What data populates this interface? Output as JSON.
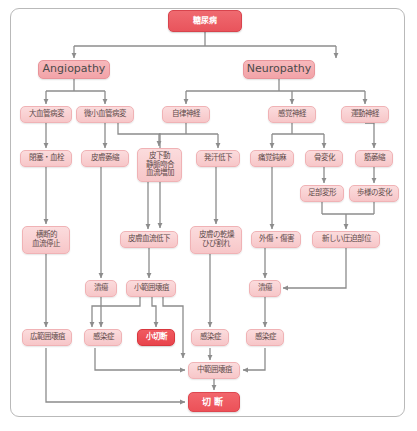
{
  "diagram": {
    "edge_color": "#8c8c8c",
    "accent_color": "#e8545c",
    "node_fill_light": "#fbdcdd",
    "node_fill_mid": "#f7b9bc",
    "frame_color": "#b9b9b9"
  },
  "nodes": [
    {
      "id": "root",
      "label": "糖尿病",
      "variant": "root",
      "x": 168,
      "y": 10,
      "w": 74,
      "h": 22
    },
    {
      "id": "angiopathy",
      "label": "Angiopathy",
      "variant": "en",
      "x": 38,
      "y": 60,
      "w": 72,
      "h": 19
    },
    {
      "id": "neuropathy",
      "label": "Neuropathy",
      "variant": "en",
      "x": 243,
      "y": 60,
      "w": 72,
      "h": 19
    },
    {
      "id": "macro",
      "label": "大血管病変",
      "variant": "jp",
      "x": 20,
      "y": 106,
      "w": 52,
      "h": 17
    },
    {
      "id": "micro",
      "label": "微小血管病変",
      "variant": "jp",
      "x": 76,
      "y": 106,
      "w": 58,
      "h": 17
    },
    {
      "id": "autonomic",
      "label": "自律神経",
      "variant": "jp",
      "x": 162,
      "y": 106,
      "w": 48,
      "h": 17
    },
    {
      "id": "sensory",
      "label": "感覚神経",
      "variant": "jp",
      "x": 268,
      "y": 106,
      "w": 48,
      "h": 17
    },
    {
      "id": "motor",
      "label": "運動神経",
      "variant": "jp",
      "x": 341,
      "y": 106,
      "w": 48,
      "h": 17
    },
    {
      "id": "occlusion",
      "label": "閉塞・血栓",
      "variant": "jp",
      "x": 20,
      "y": 150,
      "w": 52,
      "h": 17
    },
    {
      "id": "skinatrophy",
      "label": "皮膚萎縮",
      "variant": "jp",
      "x": 81,
      "y": 150,
      "w": 48,
      "h": 17
    },
    {
      "id": "avshunt",
      "label": "皮下動\n静脈吻合\n血流増加",
      "variant": "jp",
      "x": 137,
      "y": 148,
      "w": 45,
      "h": 34
    },
    {
      "id": "sweating",
      "label": "発汗低下",
      "variant": "jp",
      "x": 196,
      "y": 150,
      "w": 44,
      "h": 17
    },
    {
      "id": "painloss",
      "label": "痛覚鈍麻",
      "variant": "jp",
      "x": 250,
      "y": 150,
      "w": 44,
      "h": 17
    },
    {
      "id": "bonechange",
      "label": "骨変化",
      "variant": "jp",
      "x": 305,
      "y": 150,
      "w": 38,
      "h": 17
    },
    {
      "id": "muscleatr",
      "label": "筋萎縮",
      "variant": "jp",
      "x": 355,
      "y": 150,
      "w": 38,
      "h": 17
    },
    {
      "id": "footdeform",
      "label": "足部変形",
      "variant": "jp",
      "x": 300,
      "y": 185,
      "w": 44,
      "h": 17
    },
    {
      "id": "gaitchange",
      "label": "歩様の変化",
      "variant": "jp",
      "x": 349,
      "y": 185,
      "w": 50,
      "h": 17
    },
    {
      "id": "flowstop",
      "label": "横断的\n血流停止",
      "variant": "jp",
      "x": 22,
      "y": 226,
      "w": 48,
      "h": 28
    },
    {
      "id": "skinflow",
      "label": "皮膚血流低下",
      "variant": "jp",
      "x": 120,
      "y": 231,
      "w": 58,
      "h": 17
    },
    {
      "id": "drycrack",
      "label": "皮膚の乾燥\nひび割れ",
      "variant": "jp",
      "x": 190,
      "y": 226,
      "w": 52,
      "h": 28
    },
    {
      "id": "trauma",
      "label": "外傷・傷害",
      "variant": "jp",
      "x": 251,
      "y": 231,
      "w": 50,
      "h": 17
    },
    {
      "id": "newpress",
      "label": "新しい圧迫部位",
      "variant": "jp",
      "x": 312,
      "y": 231,
      "w": 68,
      "h": 17
    },
    {
      "id": "ulcer1",
      "label": "潰瘍",
      "variant": "jp",
      "x": 85,
      "y": 280,
      "w": 32,
      "h": 17
    },
    {
      "id": "smallgang",
      "label": "小範囲壊疽",
      "variant": "jp",
      "x": 126,
      "y": 280,
      "w": 50,
      "h": 17
    },
    {
      "id": "ulcer2",
      "label": "潰瘍",
      "variant": "jp",
      "x": 249,
      "y": 280,
      "w": 32,
      "h": 17
    },
    {
      "id": "widegang",
      "label": "広範囲壊疽",
      "variant": "jp",
      "x": 22,
      "y": 329,
      "w": 50,
      "h": 17
    },
    {
      "id": "infect1",
      "label": "感染症",
      "variant": "jp",
      "x": 84,
      "y": 329,
      "w": 38,
      "h": 17
    },
    {
      "id": "minoramp",
      "label": "小切断",
      "variant": "hl",
      "x": 137,
      "y": 329,
      "w": 38,
      "h": 17
    },
    {
      "id": "infect2",
      "label": "感染症",
      "variant": "jp",
      "x": 191,
      "y": 329,
      "w": 38,
      "h": 17
    },
    {
      "id": "infect3",
      "label": "感染症",
      "variant": "jp",
      "x": 246,
      "y": 329,
      "w": 38,
      "h": 17
    },
    {
      "id": "midgang",
      "label": "中範囲壊疽",
      "variant": "jp",
      "x": 188,
      "y": 362,
      "w": 52,
      "h": 17
    },
    {
      "id": "amputation",
      "label": "切断",
      "variant": "end",
      "x": 188,
      "y": 392,
      "w": 52,
      "h": 20
    }
  ],
  "edges": [
    {
      "from": "root",
      "to": "angiopathy",
      "kind": "tree-down"
    },
    {
      "from": "root",
      "to": "neuropathy",
      "kind": "tree-down"
    },
    {
      "from": "angiopathy",
      "to": "macro",
      "kind": "tree-down"
    },
    {
      "from": "angiopathy",
      "to": "micro",
      "kind": "tree-down"
    },
    {
      "from": "neuropathy",
      "to": "autonomic",
      "kind": "tree-down"
    },
    {
      "from": "neuropathy",
      "to": "sensory",
      "kind": "tree-down"
    },
    {
      "from": "neuropathy",
      "to": "motor",
      "kind": "tree-down"
    },
    {
      "from": "macro",
      "to": "occlusion",
      "kind": "straight"
    },
    {
      "from": "micro",
      "to": "skinatrophy",
      "kind": "tree-down"
    },
    {
      "from": "micro",
      "to": "skinflow",
      "kind": "elbow"
    },
    {
      "from": "autonomic",
      "to": "avshunt",
      "kind": "tree-down"
    },
    {
      "from": "autonomic",
      "to": "sweating",
      "kind": "tree-down"
    },
    {
      "from": "sensory",
      "to": "painloss",
      "kind": "tree-down"
    },
    {
      "from": "sensory",
      "to": "bonechange",
      "kind": "tree-down"
    },
    {
      "from": "motor",
      "to": "muscleatr",
      "kind": "straight"
    },
    {
      "from": "bonechange",
      "to": "footdeform",
      "kind": "straight"
    },
    {
      "from": "muscleatr",
      "to": "gaitchange",
      "kind": "straight"
    },
    {
      "from": "occlusion",
      "to": "flowstop",
      "kind": "straight"
    },
    {
      "from": "skinatrophy",
      "to": "ulcer1",
      "kind": "straight"
    },
    {
      "from": "avshunt",
      "to": "skinflow",
      "kind": "straight"
    },
    {
      "from": "sweating",
      "to": "drycrack",
      "kind": "straight"
    },
    {
      "from": "painloss",
      "to": "trauma",
      "kind": "straight"
    },
    {
      "from": "footdeform",
      "to": "newpress",
      "kind": "merge"
    },
    {
      "from": "gaitchange",
      "to": "newpress",
      "kind": "merge"
    },
    {
      "from": "skinflow",
      "to": "smallgang",
      "kind": "straight"
    },
    {
      "from": "drycrack",
      "to": "infect2",
      "kind": "straight"
    },
    {
      "from": "trauma",
      "to": "ulcer2",
      "kind": "straight"
    },
    {
      "from": "newpress",
      "to": "ulcer2",
      "kind": "elbow-left"
    },
    {
      "from": "flowstop",
      "to": "widegang",
      "kind": "straight"
    },
    {
      "from": "ulcer1",
      "to": "infect1",
      "kind": "straight"
    },
    {
      "from": "smallgang",
      "to": "infect1",
      "kind": "elbow"
    },
    {
      "from": "smallgang",
      "to": "minoramp",
      "kind": "elbow"
    },
    {
      "from": "smallgang",
      "to": "midgang",
      "kind": "elbow"
    },
    {
      "from": "ulcer2",
      "to": "infect3",
      "kind": "straight"
    },
    {
      "from": "infect1",
      "to": "midgang",
      "kind": "elbow"
    },
    {
      "from": "infect2",
      "to": "midgang",
      "kind": "straight"
    },
    {
      "from": "infect3",
      "to": "midgang",
      "kind": "elbow-left"
    },
    {
      "from": "widegang",
      "to": "amputation",
      "kind": "elbow"
    },
    {
      "from": "midgang",
      "to": "amputation",
      "kind": "straight"
    }
  ]
}
